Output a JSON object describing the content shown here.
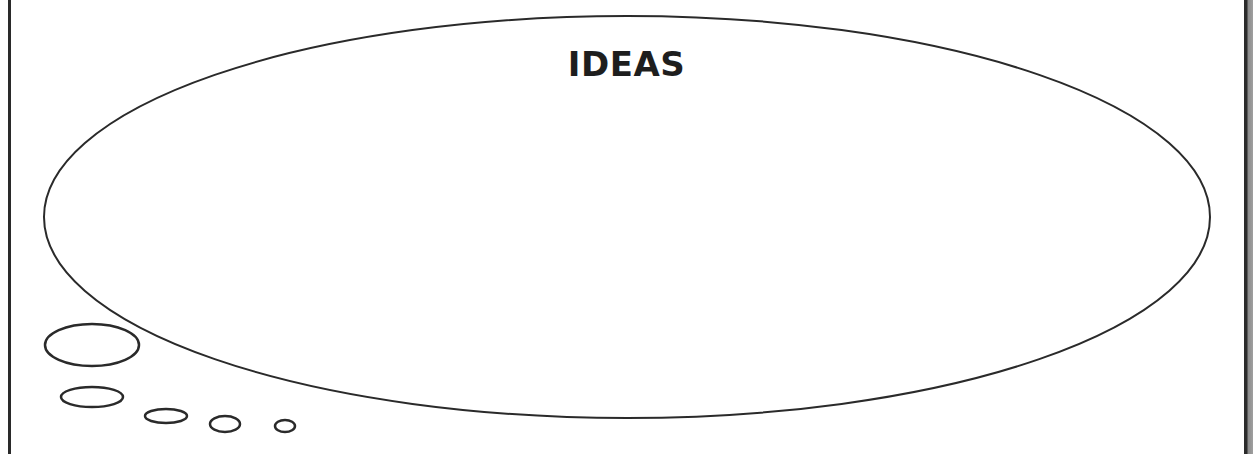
{
  "diagram": {
    "title": "IDEAS",
    "type": "thought-bubble",
    "stroke_color": "#2a2a2a",
    "background": "#ffffff",
    "main_bubble": {
      "cx": 627,
      "cy": 217,
      "rx": 583,
      "ry": 201
    },
    "trail_bubbles": [
      {
        "cx": 92,
        "cy": 345,
        "rx": 47,
        "ry": 21
      },
      {
        "cx": 92,
        "cy": 397,
        "rx": 31,
        "ry": 10
      },
      {
        "cx": 166,
        "cy": 416,
        "rx": 21,
        "ry": 7
      },
      {
        "cx": 225,
        "cy": 424,
        "rx": 15,
        "ry": 8
      },
      {
        "cx": 285,
        "cy": 426,
        "rx": 10,
        "ry": 6
      }
    ]
  }
}
